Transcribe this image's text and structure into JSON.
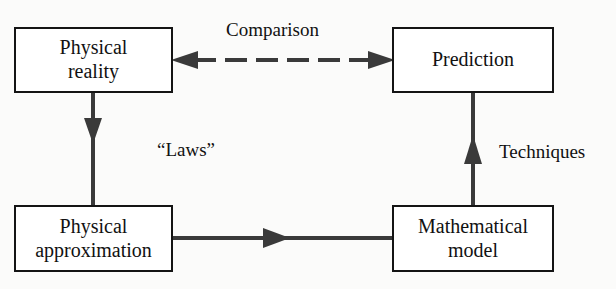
{
  "diagram": {
    "type": "flow-diagram",
    "colors": {
      "background": "#fbfbfa",
      "node_fill": "#ffffff",
      "stroke": "#141414",
      "text": "#111111"
    },
    "nodes": [
      {
        "id": "physical-reality",
        "label": "Physical\nreality"
      },
      {
        "id": "prediction",
        "label": "Prediction"
      },
      {
        "id": "physical-approximation",
        "label": "Physical\napproximation"
      },
      {
        "id": "mathematical-model",
        "label": "Mathematical\nmodel"
      }
    ],
    "edges": [
      {
        "id": "comparison",
        "label": "Comparison",
        "from": "prediction",
        "to": "physical-reality",
        "style": "dashed",
        "arrowheads": "both"
      },
      {
        "id": "laws",
        "label": "“Laws”",
        "from": "physical-reality",
        "to": "physical-approximation",
        "style": "solid",
        "arrowheads": "end"
      },
      {
        "id": "techniques",
        "label": "Techniques",
        "from": "mathematical-model",
        "to": "prediction",
        "style": "solid",
        "arrowheads": "end"
      },
      {
        "id": "derivation",
        "label": "",
        "from": "physical-approximation",
        "to": "mathematical-model",
        "style": "solid",
        "arrowheads": "end"
      }
    ]
  }
}
